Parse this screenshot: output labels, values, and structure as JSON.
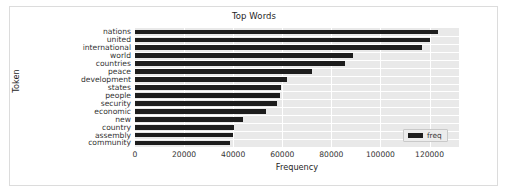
{
  "figure": {
    "title": "Top Words",
    "background_color": "#ffffff",
    "plot_background_color": "#e9e9e9",
    "grid_color": "#ffffff",
    "bar_color": "#1d1d1d",
    "frame_color": "#dcdcdc"
  },
  "legend": {
    "position": "lower-right",
    "entries": [
      {
        "label": "freq",
        "color": "#1d1d1d"
      }
    ]
  },
  "chart_data": {
    "type": "bar",
    "orientation": "horizontal",
    "title": "Top Words",
    "xlabel": "Frequency",
    "ylabel": "Token",
    "xlim": [
      0,
      132000
    ],
    "ylim": null,
    "grid": true,
    "legend_position": "lower right",
    "xticks": [
      0,
      20000,
      40000,
      60000,
      80000,
      100000,
      120000
    ],
    "xtick_labels": [
      "0",
      "20000",
      "40000",
      "60000",
      "80000",
      "100000",
      "120000"
    ],
    "categories": [
      "nations",
      "united",
      "international",
      "world",
      "countries",
      "peace",
      "development",
      "states",
      "people",
      "security",
      "economic",
      "new",
      "country",
      "assembly",
      "community"
    ],
    "series": [
      {
        "name": "freq",
        "color": "#1d1d1d",
        "values": [
          123500,
          120000,
          117000,
          89000,
          85500,
          72000,
          62000,
          59500,
          59000,
          58000,
          53500,
          44000,
          40500,
          40000,
          38500
        ]
      }
    ]
  }
}
